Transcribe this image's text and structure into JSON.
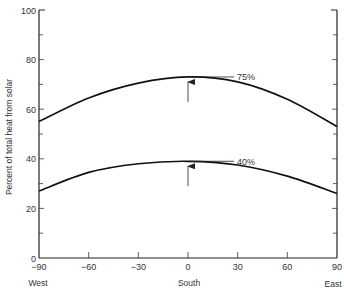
{
  "chart_data": {
    "type": "line",
    "title": "",
    "xlabel": "",
    "ylabel": "Percent of total heat from solar",
    "xlim": [
      -90,
      90
    ],
    "ylim": [
      0,
      100
    ],
    "x_ticks": [
      -90,
      -60,
      -30,
      0,
      30,
      60,
      90
    ],
    "x_tick_labels": [
      "−90",
      "−60",
      "−30",
      "0",
      "30",
      "60",
      "90"
    ],
    "y_ticks": [
      0,
      20,
      40,
      60,
      80,
      100
    ],
    "y_tick_labels": [
      "0",
      "20",
      "40",
      "60",
      "80",
      "100"
    ],
    "direction_labels": {
      "west": "West",
      "south": "South",
      "east": "East"
    },
    "grid": false,
    "x": [
      -90,
      -60,
      -30,
      0,
      30,
      60,
      90
    ],
    "series": [
      {
        "name": "upper curve",
        "values": [
          55,
          64.5,
          70.5,
          73,
          71,
          64,
          53
        ],
        "annotation": "75%",
        "peak_x": 0
      },
      {
        "name": "lower curve",
        "values": [
          27,
          34.5,
          38,
          39,
          37.5,
          33,
          26
        ],
        "annotation": "40%",
        "peak_x": 0
      }
    ],
    "annotations": [
      {
        "text": "75%",
        "x": 0,
        "y": 73,
        "arrow": "up from below at x=0"
      },
      {
        "text": "40%",
        "x": 0,
        "y": 39,
        "arrow": "up from below at x=0"
      }
    ]
  }
}
